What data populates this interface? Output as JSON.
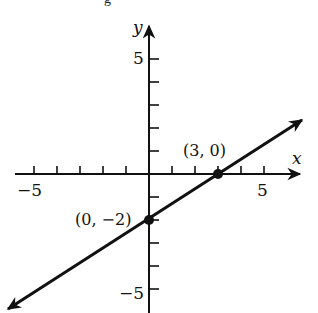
{
  "figure": {
    "type": "coordinate-graph",
    "partial_text_top": "g",
    "axes": {
      "x_label": "x",
      "y_label": "y",
      "x_tick_labels": [
        {
          "value": -5,
          "text": "−5"
        },
        {
          "value": 5,
          "text": "5"
        }
      ],
      "y_tick_labels": [
        {
          "value": 5,
          "text": "5"
        },
        {
          "value": -5,
          "text": "−5"
        }
      ],
      "x_range": [
        -5.8,
        6.8
      ],
      "y_range": [
        -5.9,
        6.7
      ],
      "ticks_x": [
        -5,
        -4,
        -3,
        -2,
        -1,
        1,
        2,
        3,
        4,
        5
      ],
      "ticks_y": [
        -5,
        -4,
        -3,
        -2,
        -1,
        1,
        2,
        3,
        4,
        5
      ]
    },
    "line": {
      "equation": "y = (2/3)x - 2",
      "slope": 0.6667,
      "intercept": -2,
      "arrows": "both",
      "color": "#111111"
    },
    "points": [
      {
        "x": 3,
        "y": 0,
        "label": "(3, 0)"
      },
      {
        "x": 0,
        "y": -2,
        "label": "(0, −2)"
      }
    ]
  }
}
